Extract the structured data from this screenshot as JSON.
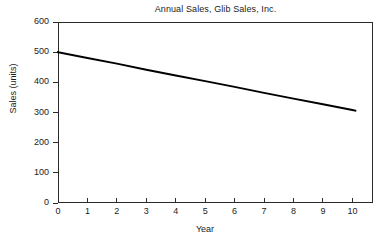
{
  "chart_data": {
    "type": "line",
    "title": "Annual Sales, Glib Sales, Inc.",
    "xlabel": "Year",
    "ylabel": "Sales (units)",
    "xlim": [
      0,
      10.7
    ],
    "ylim": [
      0,
      600
    ],
    "grid": false,
    "legend": null,
    "x_ticks": [
      0,
      1,
      2,
      3,
      4,
      5,
      6,
      7,
      8,
      9,
      10
    ],
    "x_tick_labels": [
      "0",
      "1",
      "2",
      "3",
      "4",
      "5",
      "6",
      "7",
      "8",
      "9",
      "10"
    ],
    "y_ticks": [
      0,
      100,
      200,
      300,
      400,
      500,
      600
    ],
    "y_tick_labels": [
      "0",
      "100",
      "200",
      "300",
      "400",
      "500",
      "600"
    ],
    "series": [
      {
        "name": "Annual Sales",
        "color": "#000000",
        "line_width": 2,
        "x": [
          0,
          1,
          2,
          3,
          4,
          5,
          6,
          7,
          8,
          9,
          10,
          10.1
        ],
        "values": [
          500,
          481,
          462,
          442,
          423,
          404,
          385,
          365,
          346,
          327,
          308,
          306
        ]
      }
    ],
    "annotations": []
  },
  "chart": {
    "title": "Annual Sales, Glib Sales, Inc.",
    "x_axis_label": "Year",
    "y_axis_label": "Sales (units)",
    "axis_color": "#2b2b2b",
    "line_color": "#000000",
    "background_color": "#ffffff"
  }
}
